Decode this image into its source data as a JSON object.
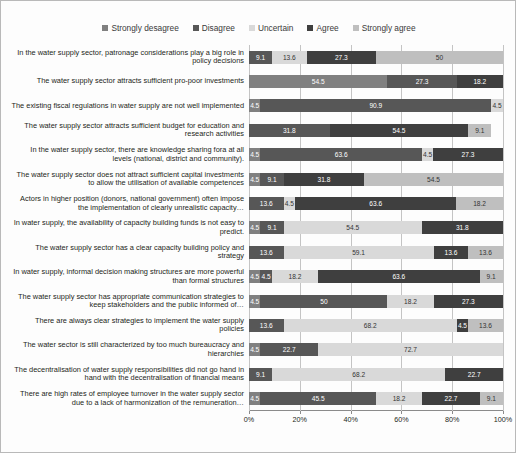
{
  "chart_data": {
    "type": "bar",
    "subtype": "stacked-horizontal-100pct",
    "title": "",
    "xlabel": "",
    "ylabel": "",
    "xlim": [
      0,
      100
    ],
    "xticks": [
      "0%",
      "20%",
      "40%",
      "60%",
      "80%",
      "100%"
    ],
    "grid": true,
    "legend_position": "top-center",
    "legend": [
      "Strongly desagree",
      "Disagree",
      "Uncertain",
      "Agree",
      "Strongly agree"
    ],
    "colors": [
      "#808080",
      "#575757",
      "#d9d9d9",
      "#3f3f3f",
      "#bfbfbf"
    ],
    "categories": [
      "In the water supply sector, patronage considerations play a big role in policy decisions",
      "The water supply sector attracts sufficient pro-poor investments",
      "The existing fiscal regulations in water supply are not well implemented",
      "The water supply sector attracts sufficient budget for education and research activities",
      "In the water supply sector, there are knowledge sharing fora at all levels (national, district and community).",
      "The water supply sector does not attract sufficient capital investments to allow the utilisation of available competences",
      "Actors in higher position (donors, national government) often impose the implementation of clearly unrealistic capacity…",
      "In water supply, the availability of capacity building funds is not easy to predict.",
      "The water supply sector has a clear capacity building policy and strategy",
      "In water supply, informal decision making structures are more powerful than formal structures",
      "The water supply sector has appropriate communication strategies to keep stakeholders and the public informed of…",
      "There are always clear strategies to implement the water supply policies",
      "The water sector is still characterized by too much bureaucracy and hierarchies",
      "The decentralisation of water supply responsibilities did not go hand in hand with the decentralisation of financial means",
      "There are high rates of employee turnover in the water supply sector due to a lack of harmonization of the remuneration…"
    ],
    "series": [
      {
        "name": "Strongly desagree",
        "values": [
          0,
          54.5,
          4.5,
          0,
          4.5,
          4.5,
          0,
          4.5,
          0,
          4.5,
          4.5,
          0,
          4.5,
          0,
          4.5
        ]
      },
      {
        "name": "Disagree",
        "values": [
          9.1,
          27.3,
          90.9,
          31.8,
          63.6,
          9.1,
          13.6,
          9.1,
          13.6,
          4.5,
          50,
          13.6,
          22.7,
          9.1,
          45.5
        ]
      },
      {
        "name": "Uncertain",
        "values": [
          13.6,
          0,
          4.5,
          0,
          4.5,
          0,
          4.5,
          54.5,
          59.1,
          18.2,
          18.2,
          68.2,
          72.7,
          68.2,
          18.2
        ]
      },
      {
        "name": "Agree",
        "values": [
          27.3,
          18.2,
          0,
          54.5,
          27.3,
          31.8,
          63.6,
          31.8,
          13.6,
          63.6,
          27.3,
          4.5,
          0,
          22.7,
          22.7
        ]
      },
      {
        "name": "Strongly agree",
        "values": [
          50,
          0,
          0,
          9.1,
          0,
          54.5,
          18.2,
          0,
          13.6,
          9.1,
          0,
          13.6,
          0,
          0,
          9.1
        ]
      }
    ],
    "data_labels": [
      [
        "0",
        "9.1",
        "13.6",
        "27.3",
        "50"
      ],
      [
        "54.5",
        "27.3",
        "0",
        "18.2",
        "0"
      ],
      [
        "4.5",
        "90.9",
        "4.5",
        "",
        ""
      ],
      [
        "",
        "31.8",
        "",
        "54.5",
        "4.5",
        "9.1",
        "0"
      ],
      [
        "4.5",
        "63.6",
        "4.5",
        "27.3",
        "0"
      ],
      [
        "4.5",
        "9.1",
        "0",
        "31.8",
        "54.5"
      ],
      [
        "0",
        "13.6",
        "4.5",
        "63.6",
        "18.2"
      ],
      [
        "4.5",
        "9.1",
        "54.5",
        "31.8",
        ""
      ],
      [
        "0",
        "13.6",
        "59.1",
        "13.6",
        "13.6"
      ],
      [
        "4.5",
        "4.5",
        "18.2",
        "63.6",
        "9.1"
      ],
      [
        "4.5",
        "50",
        "18.2",
        "27.3",
        "0"
      ],
      [
        "13.6",
        "68.2",
        "4.5",
        "13.6",
        "0"
      ],
      [
        "4.5",
        "22.7",
        "72.7",
        "",
        ""
      ],
      [
        "0",
        "9.1",
        "68.2",
        "22.7",
        ""
      ],
      [
        "4.5",
        "45.5",
        "18.2",
        "22.7",
        "9.1"
      ]
    ]
  }
}
